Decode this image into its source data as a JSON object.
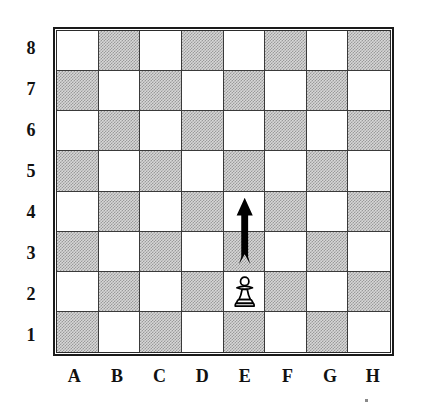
{
  "diagram": {
    "board_size": 8,
    "colors": {
      "light_square": "#ffffff",
      "dark_square": "#c9c9c9",
      "border": "#1a1a1a",
      "gridline": "#3a3a3a",
      "label_text": "#111111",
      "arrow": "#000000",
      "piece_outline": "#000000",
      "piece_fill": "#ffffff"
    }
  },
  "rank_labels": [
    "8",
    "7",
    "6",
    "5",
    "4",
    "3",
    "2",
    "1"
  ],
  "file_labels": [
    "A",
    "B",
    "C",
    "D",
    "E",
    "F",
    "G",
    "H"
  ],
  "squares": [
    [
      "light",
      "dark",
      "light",
      "dark",
      "light",
      "dark",
      "light",
      "dark"
    ],
    [
      "dark",
      "light",
      "dark",
      "light",
      "dark",
      "light",
      "dark",
      "light"
    ],
    [
      "light",
      "dark",
      "light",
      "dark",
      "light",
      "dark",
      "light",
      "dark"
    ],
    [
      "dark",
      "light",
      "dark",
      "light",
      "dark",
      "light",
      "dark",
      "light"
    ],
    [
      "light",
      "dark",
      "light",
      "dark",
      "light",
      "dark",
      "light",
      "dark"
    ],
    [
      "dark",
      "light",
      "dark",
      "light",
      "dark",
      "light",
      "dark",
      "light"
    ],
    [
      "light",
      "dark",
      "light",
      "dark",
      "light",
      "dark",
      "light",
      "dark"
    ],
    [
      "dark",
      "light",
      "dark",
      "light",
      "dark",
      "light",
      "dark",
      "light"
    ]
  ],
  "pieces": [
    {
      "name": "white-pawn",
      "icon": "pawn-icon",
      "color": "white",
      "square": "E2",
      "file": "E",
      "rank": "2"
    }
  ],
  "annotations": [
    {
      "name": "move-arrow",
      "icon": "arrow-up-icon",
      "type": "arrow",
      "direction": "up",
      "from_square": "E3",
      "to_square": "E4",
      "label": "E3 to E4"
    }
  ],
  "chart_data": {
    "type": "table",
    "xlabel": "Files",
    "ylabel": "Ranks",
    "categories": [
      "A",
      "B",
      "C",
      "D",
      "E",
      "F",
      "G",
      "H"
    ],
    "rows": [
      "8",
      "7",
      "6",
      "5",
      "4",
      "3",
      "2",
      "1"
    ],
    "values": [
      [
        "",
        "",
        "",
        "",
        "",
        "",
        "",
        ""
      ],
      [
        "",
        "",
        "",
        "",
        "",
        "",
        "",
        ""
      ],
      [
        "",
        "",
        "",
        "",
        "",
        "",
        "",
        ""
      ],
      [
        "",
        "",
        "",
        "",
        "",
        "",
        "",
        ""
      ],
      [
        "",
        "",
        "",
        "",
        "arrow-head",
        "",
        "",
        ""
      ],
      [
        "",
        "",
        "",
        "",
        "arrow-shaft",
        "",
        "",
        ""
      ],
      [
        "",
        "",
        "",
        "",
        "white-pawn",
        "",
        "",
        ""
      ],
      [
        "",
        "",
        "",
        "",
        "",
        "",
        "",
        ""
      ]
    ],
    "legend": [
      "white-pawn on E2",
      "arrow E3 to E4"
    ],
    "grid": true
  }
}
